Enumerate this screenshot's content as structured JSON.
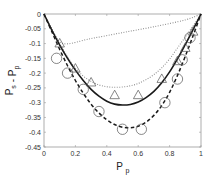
{
  "chart_data": {
    "type": "line",
    "title": "",
    "xlabel": "P_p",
    "ylabel": "P_s - P_p",
    "xlabel_main": "P",
    "xlabel_sub": "p",
    "ylabel_parts": {
      "a": "P",
      "a_sub": "s",
      "mid": " - ",
      "b": "P",
      "b_sub": "p"
    },
    "xlim": [
      0,
      1
    ],
    "ylim": [
      -0.45,
      0
    ],
    "grid": false,
    "legend": null,
    "xticks": [
      0,
      0.2,
      0.4,
      0.6,
      0.8,
      1
    ],
    "xtick_labels": [
      "0",
      "0.2",
      "0.4",
      "0.6",
      "0.8",
      "1"
    ],
    "yticks": [
      0,
      -0.05,
      -0.1,
      -0.15,
      -0.2,
      -0.25,
      -0.3,
      -0.35,
      -0.4,
      -0.45
    ],
    "ytick_labels": [
      "0",
      "-0.05",
      "-0.1",
      "-0.15",
      "-0.2",
      "-0.25",
      "-0.3",
      "-0.35",
      "-0.4",
      "-0.45"
    ],
    "series": [
      {
        "name": "solid curve",
        "style": "solid",
        "color": "#1a1a1a",
        "x": [
          0,
          0.05,
          0.1,
          0.15,
          0.2,
          0.25,
          0.3,
          0.35,
          0.4,
          0.45,
          0.5,
          0.55,
          0.6,
          0.65,
          0.7,
          0.75,
          0.8,
          0.85,
          0.9,
          0.95,
          1
        ],
        "y": [
          0,
          -0.055,
          -0.105,
          -0.15,
          -0.19,
          -0.225,
          -0.255,
          -0.278,
          -0.295,
          -0.305,
          -0.308,
          -0.306,
          -0.298,
          -0.283,
          -0.262,
          -0.233,
          -0.196,
          -0.152,
          -0.103,
          -0.052,
          0
        ]
      },
      {
        "name": "dashed curve",
        "style": "dashed",
        "color": "#1a1a1a",
        "x": [
          0,
          0.05,
          0.1,
          0.15,
          0.2,
          0.25,
          0.3,
          0.35,
          0.4,
          0.45,
          0.5,
          0.55,
          0.6,
          0.65,
          0.7,
          0.75,
          0.8,
          0.85,
          0.9,
          0.95,
          1
        ],
        "y": [
          0,
          -0.06,
          -0.12,
          -0.175,
          -0.225,
          -0.268,
          -0.305,
          -0.335,
          -0.358,
          -0.374,
          -0.383,
          -0.385,
          -0.38,
          -0.366,
          -0.343,
          -0.31,
          -0.265,
          -0.208,
          -0.143,
          -0.073,
          0
        ]
      },
      {
        "name": "lower dotted curve",
        "style": "dotted",
        "color": "#888888",
        "x": [
          0,
          0.05,
          0.1,
          0.15,
          0.2,
          0.25,
          0.3,
          0.35,
          0.4,
          0.45,
          0.5,
          0.55,
          0.6,
          0.65,
          0.7,
          0.75,
          0.8,
          0.85,
          0.9,
          0.95,
          1
        ],
        "y": [
          0,
          -0.05,
          -0.1,
          -0.145,
          -0.183,
          -0.21,
          -0.228,
          -0.24,
          -0.246,
          -0.248,
          -0.247,
          -0.243,
          -0.235,
          -0.222,
          -0.205,
          -0.182,
          -0.152,
          -0.115,
          -0.078,
          -0.04,
          0
        ]
      },
      {
        "name": "upper dotted line",
        "style": "dotted",
        "color": "#888888",
        "x": [
          0,
          0.05,
          0.12,
          0.3,
          0.5,
          0.7,
          0.9,
          1
        ],
        "y": [
          0,
          -0.05,
          -0.1,
          -0.083,
          -0.063,
          -0.043,
          -0.02,
          0
        ]
      },
      {
        "name": "triangle markers",
        "style": "markers",
        "marker": "triangle",
        "color": "#555555",
        "x": [
          0.1,
          0.2,
          0.3,
          0.45,
          0.6,
          0.75,
          0.85,
          0.9,
          0.95
        ],
        "y": [
          -0.1,
          -0.185,
          -0.232,
          -0.275,
          -0.275,
          -0.22,
          -0.16,
          -0.115,
          -0.06
        ]
      },
      {
        "name": "circle markers",
        "style": "markers",
        "marker": "circle",
        "color": "#555555",
        "x": [
          0.08,
          0.15,
          0.25,
          0.35,
          0.5,
          0.62,
          0.77,
          0.85,
          0.88,
          0.93
        ],
        "y": [
          -0.15,
          -0.2,
          -0.255,
          -0.33,
          -0.39,
          -0.39,
          -0.3,
          -0.22,
          -0.155,
          -0.08
        ]
      }
    ]
  },
  "layout": {
    "plot_left": 44,
    "plot_right": 201,
    "plot_top": 14,
    "plot_bottom": 147
  }
}
